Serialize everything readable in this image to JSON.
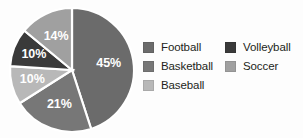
{
  "chart_data": {
    "type": "pie",
    "title": "",
    "xlabel": "",
    "ylabel": "",
    "categories": [
      "Football",
      "Basketball",
      "Baseball",
      "Volleyball",
      "Soccer"
    ],
    "values": [
      45,
      21,
      10,
      10,
      14
    ],
    "value_labels": [
      "45%",
      "21%",
      "10%",
      "10%",
      "14%"
    ],
    "unit": "%",
    "total": 100,
    "start_angle_deg": 0,
    "direction": "clockwise",
    "legend_position": "right",
    "legend_columns": 2,
    "grid": false,
    "colors": [
      "#6b6b6b",
      "#777777",
      "#b8b8b8",
      "#3a3a3a",
      "#a0a0a0"
    ],
    "slices": [
      {
        "label": "Football",
        "value": 45,
        "value_label": "45%",
        "color": "#6b6b6b"
      },
      {
        "label": "Basketball",
        "value": 21,
        "value_label": "21%",
        "color": "#777777"
      },
      {
        "label": "Baseball",
        "value": 10,
        "value_label": "10%",
        "color": "#b8b8b8"
      },
      {
        "label": "Volleyball",
        "value": 10,
        "value_label": "10%",
        "color": "#3a3a3a"
      },
      {
        "label": "Soccer",
        "value": 14,
        "value_label": "14%",
        "color": "#a0a0a0"
      }
    ]
  },
  "legend": {
    "columns": [
      {
        "items": [
          {
            "label": "Football",
            "color": "#6b6b6b"
          },
          {
            "label": "Basketball",
            "color": "#777777"
          },
          {
            "label": "Baseball",
            "color": "#b8b8b8"
          }
        ]
      },
      {
        "items": [
          {
            "label": "Volleyball",
            "color": "#3a3a3a"
          },
          {
            "label": "Soccer",
            "color": "#a0a0a0"
          }
        ]
      }
    ]
  },
  "page": {
    "background_color": "#fdfdfd",
    "label_text_color": "#ffffff",
    "legend_text_color": "#231f20"
  }
}
